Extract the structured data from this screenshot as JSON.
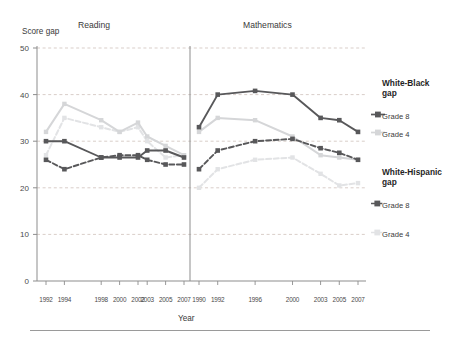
{
  "axis": {
    "y_title": "Score gap",
    "x_title": "Year",
    "y_ticks": [
      "0",
      "10",
      "20",
      "30",
      "40",
      "50"
    ],
    "ylim": [
      0,
      50
    ]
  },
  "panels": {
    "reading_title": "Reading",
    "math_title": "Mathematics"
  },
  "legend": {
    "group1_title": "White-Black gap",
    "group1_line1": "White-Black",
    "group1_line2": "gap",
    "group2_title": "White-Hispanic gap",
    "group2_line1": "White-Hispanic",
    "group2_line2": "gap",
    "grade8_label": "Grade 8",
    "grade4_label": "Grade 4",
    "wb_grade8_label": "Grade 8",
    "wb_grade4_label": "Grade 4",
    "wh_grade8_label": "Grade 8",
    "wh_grade4_label": "Grade 4"
  },
  "colors": {
    "wb_grade8": "#58585a",
    "wb_grade4": "#d5d6d8",
    "wh_grade8": "#58585a",
    "wh_grade4": "#e2e3e5",
    "gridline": "#c9b9b2",
    "axis": "#8d8d8d",
    "text": "#3a3a3a"
  },
  "chart_data": {
    "type": "line",
    "title": "Score gap",
    "xlabel": "Year",
    "ylabel": "Score gap",
    "ylim": [
      0,
      50
    ],
    "grid": true,
    "legend_position": "right",
    "panels": [
      {
        "name": "Reading",
        "x": [
          1992,
          1994,
          1998,
          2000,
          2002,
          2003,
          2005,
          2007
        ],
        "xtick_labels": [
          "1992",
          "1994",
          "1998",
          "2000",
          "2002",
          "2003",
          "2005",
          "2007"
        ],
        "series": [
          {
            "name": "White-Black gap, Grade 8",
            "style": "solid-dark",
            "values": [
              30,
              30,
              26.5,
              26.5,
              26.5,
              28,
              28,
              26.5
            ]
          },
          {
            "name": "White-Black gap, Grade 4",
            "style": "solid-light",
            "values": [
              32,
              38,
              34.5,
              32,
              34,
              31,
              29,
              27
            ]
          },
          {
            "name": "White-Hispanic gap, Grade 8",
            "style": "dashed-dark",
            "values": [
              26,
              24,
              26.5,
              27,
              27,
              26,
              25,
              25
            ]
          },
          {
            "name": "White-Hispanic gap, Grade 4",
            "style": "dashed-light",
            "values": [
              27,
              35,
              33,
              32,
              33,
              30,
              26.5,
              27
            ]
          }
        ]
      },
      {
        "name": "Mathematics",
        "x": [
          1990,
          1992,
          1996,
          2000,
          2003,
          2005,
          2007
        ],
        "xtick_labels": [
          "1990",
          "1992",
          "1996",
          "2000",
          "2003",
          "2005",
          "2007"
        ],
        "series": [
          {
            "name": "White-Black gap, Grade 8",
            "style": "solid-dark",
            "values": [
              33,
              40,
              40.8,
              40,
              35,
              34.5,
              32
            ]
          },
          {
            "name": "White-Black gap, Grade 4",
            "style": "solid-light",
            "values": [
              32,
              35,
              34.5,
              31,
              27,
              26.5,
              26
            ]
          },
          {
            "name": "White-Hispanic gap, Grade 8",
            "style": "dashed-dark",
            "values": [
              24,
              28,
              30,
              30.5,
              28.5,
              27.5,
              26
            ]
          },
          {
            "name": "White-Hispanic gap, Grade 4",
            "style": "dashed-light",
            "values": [
              20,
              24,
              26,
              26.5,
              23,
              20.5,
              21
            ]
          }
        ]
      }
    ]
  }
}
